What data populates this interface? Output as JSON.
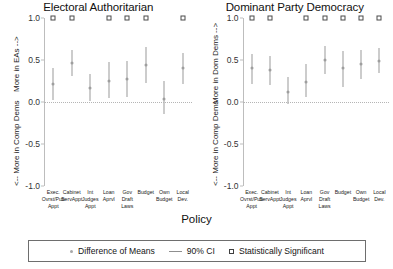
{
  "axis_title": "Policy",
  "legend": {
    "items": [
      {
        "key": "dot",
        "label": "Difference of Means"
      },
      {
        "key": "line",
        "label": "90% CI"
      },
      {
        "key": "square",
        "label": "Statistically Significant"
      }
    ]
  },
  "colors": {
    "point": "#9e9e9e",
    "ci": "#9a9a9a",
    "square_border": "#4a4a4a",
    "axis": "#bdbdbd",
    "zero_line": "#b5b5b5",
    "text": "#1a1a1a",
    "background": "#ffffff"
  },
  "panels": [
    {
      "title": "Electoral Authoritarian",
      "y_upper_label": "More in EAs -->",
      "y_lower_label": "<-- More in Comp Dems"
    },
    {
      "title": "Dominant Party Democracy",
      "y_upper_label": "More in Dom Dems -->",
      "y_lower_label": "<-- More in Comp Dems"
    }
  ],
  "chart_data": {
    "type": "scatter",
    "title": "",
    "xlabel": "Policy",
    "ylabel": "Difference of Means",
    "ylim": [
      -1.0,
      1.0
    ],
    "yticks": [
      1.0,
      0.5,
      0.0,
      -0.5,
      -1.0
    ],
    "ytick_labels": [
      "1.0",
      "0.5",
      "0.0",
      "-0.5",
      "-1.0"
    ],
    "grid": false,
    "zero_reference_line": 0.0,
    "significance_marker_y": 1.0,
    "legend_position": "bottom",
    "categories": [
      "Exec. Ovrst/Pub\nAppt",
      "Cabinet\nServAppt",
      "Int\nJudges\nAppt",
      "Loan\nAprvl",
      "Gov\nDraft\nLaws",
      "Budget",
      "Own\nBudget",
      "Local\nDev."
    ],
    "panels": [
      {
        "name": "Electoral Authoritarian",
        "values": [
          0.22,
          0.46,
          0.17,
          0.25,
          0.27,
          0.44,
          0.04,
          0.41
        ],
        "ci_lower": [
          0.02,
          0.31,
          0.01,
          0.05,
          0.06,
          0.23,
          -0.14,
          0.21
        ],
        "ci_upper": [
          0.4,
          0.62,
          0.33,
          0.48,
          0.49,
          0.66,
          0.25,
          0.58
        ],
        "significant": [
          true,
          true,
          false,
          true,
          true,
          true,
          false,
          true
        ]
      },
      {
        "name": "Dominant Party Democracy",
        "values": [
          0.4,
          0.38,
          0.12,
          0.24,
          0.5,
          0.41,
          0.45,
          0.49
        ],
        "ci_lower": [
          0.22,
          0.2,
          -0.02,
          0.06,
          0.33,
          0.18,
          0.27,
          0.35
        ],
        "ci_upper": [
          0.57,
          0.55,
          0.3,
          0.45,
          0.67,
          0.61,
          0.62,
          0.64
        ],
        "significant": [
          true,
          true,
          false,
          true,
          true,
          true,
          true,
          true
        ]
      }
    ]
  }
}
